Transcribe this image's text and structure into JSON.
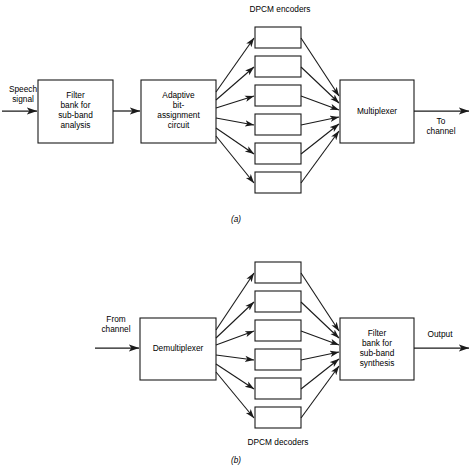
{
  "figure": {
    "width": 472,
    "height": 470,
    "background": "#ffffff",
    "line_color": "#1a1a1a",
    "text_color": "#000000",
    "type": "block-diagram"
  },
  "panel_a": {
    "caption": "(a)",
    "group_label": "DPCM encoders",
    "input_label_line1": "Speech",
    "input_label_line2": "signal",
    "output_label_line1": "To",
    "output_label_line2": "channel",
    "blocks": {
      "filter_bank": {
        "lines": [
          "Filter",
          "bank for",
          "sub-band",
          "analysis"
        ]
      },
      "bit_assignment": {
        "lines": [
          "Adaptive",
          "bit-",
          "assignment",
          "circuit"
        ]
      },
      "multiplexer": {
        "lines": [
          "Multiplexer"
        ]
      }
    },
    "encoder_count": 6,
    "encoder_labels": [
      "",
      "",
      "",
      "",
      "",
      ""
    ]
  },
  "panel_b": {
    "caption": "(b)",
    "group_label": "DPCM decoders",
    "input_label_line1": "From",
    "input_label_line2": "channel",
    "output_label_line1": "Output",
    "blocks": {
      "demultiplexer": {
        "lines": [
          "Demultiplexer"
        ]
      },
      "filter_bank": {
        "lines": [
          "Filter",
          "bank for",
          "sub-band",
          "synthesis"
        ]
      }
    },
    "decoder_count": 6,
    "decoder_labels": [
      "",
      "",
      "",
      "",
      "",
      ""
    ]
  }
}
